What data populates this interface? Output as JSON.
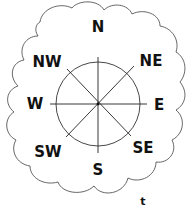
{
  "diagram": {
    "type": "compass-rose",
    "frame": "cloud-outline",
    "colors": {
      "background": "#ffffff",
      "outline": "#555555",
      "lines": "#222222",
      "text": "#111111"
    },
    "directions": [
      {
        "key": "N",
        "label": "N"
      },
      {
        "key": "NE",
        "label": "NE"
      },
      {
        "key": "E",
        "label": "E"
      },
      {
        "key": "SE",
        "label": "SE"
      },
      {
        "key": "S",
        "label": "S"
      },
      {
        "key": "SW",
        "label": "SW"
      },
      {
        "key": "W",
        "label": "W"
      },
      {
        "key": "NW",
        "label": "NW"
      }
    ],
    "corner_mark": "t"
  }
}
